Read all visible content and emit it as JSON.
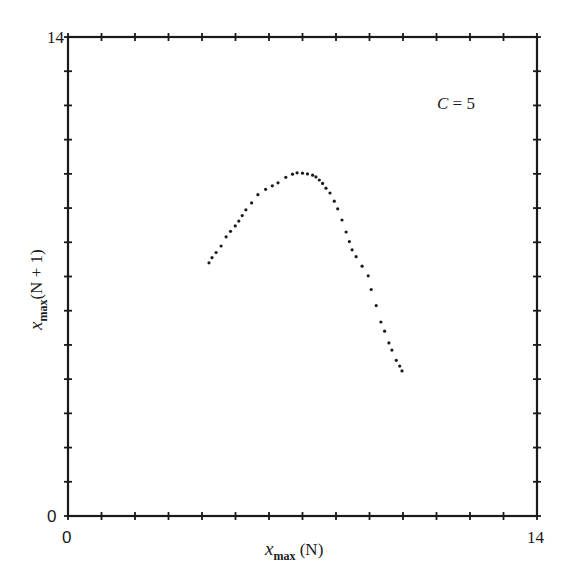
{
  "chart_data": {
    "type": "scatter",
    "title": "",
    "xlabel": "x_max (N)",
    "ylabel": "x_max(N + 1)",
    "xlabel_main": "x",
    "xlabel_sub": "max",
    "xlabel_suffix": " (N)",
    "ylabel_main": "x",
    "ylabel_sub": "max",
    "ylabel_suffix": "(N + 1)",
    "xlim": [
      0,
      14
    ],
    "ylim": [
      0,
      14
    ],
    "x_tick_labels": [
      "0",
      "14"
    ],
    "y_tick_labels": [
      "0",
      "14"
    ],
    "minor_tick_step": 1,
    "grid": false,
    "annotations": [
      {
        "text_italic": "C",
        "text_rest": " = 5",
        "x": 11.1,
        "y": 12.2
      }
    ],
    "series": [
      {
        "name": "return map",
        "color": "#1a1a1a",
        "points": [
          [
            4.21,
            7.4
          ],
          [
            4.3,
            7.55
          ],
          [
            4.42,
            7.7
          ],
          [
            4.57,
            7.89
          ],
          [
            4.72,
            8.16
          ],
          [
            4.85,
            8.32
          ],
          [
            4.99,
            8.48
          ],
          [
            5.1,
            8.62
          ],
          [
            5.2,
            8.78
          ],
          [
            5.31,
            8.95
          ],
          [
            5.48,
            9.15
          ],
          [
            5.67,
            9.39
          ],
          [
            5.9,
            9.55
          ],
          [
            6.1,
            9.65
          ],
          [
            6.27,
            9.74
          ],
          [
            6.5,
            9.9
          ],
          [
            6.7,
            9.99
          ],
          [
            6.84,
            10.03
          ],
          [
            7.0,
            10.02
          ],
          [
            7.15,
            10.0
          ],
          [
            7.3,
            9.96
          ],
          [
            7.4,
            9.91
          ],
          [
            7.5,
            9.82
          ],
          [
            7.6,
            9.72
          ],
          [
            7.7,
            9.58
          ],
          [
            7.82,
            9.44
          ],
          [
            7.95,
            9.2
          ],
          [
            8.05,
            8.98
          ],
          [
            8.18,
            8.65
          ],
          [
            8.3,
            8.3
          ],
          [
            8.4,
            8.02
          ],
          [
            8.48,
            7.78
          ],
          [
            8.6,
            7.58
          ],
          [
            8.78,
            7.3
          ],
          [
            8.96,
            7.02
          ],
          [
            9.05,
            6.62
          ],
          [
            9.2,
            6.15
          ],
          [
            9.34,
            5.67
          ],
          [
            9.45,
            5.4
          ],
          [
            9.58,
            5.06
          ],
          [
            9.67,
            4.85
          ],
          [
            9.8,
            4.55
          ],
          [
            9.9,
            4.38
          ],
          [
            9.97,
            4.24
          ]
        ]
      }
    ]
  }
}
